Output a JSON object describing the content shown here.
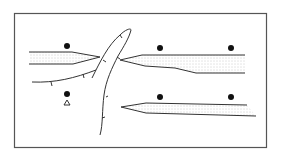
{
  "diagram": {
    "type": "schematic",
    "frame": {
      "x": 14,
      "y": 13,
      "w": 253,
      "h": 135
    },
    "colors": {
      "line": "#333333",
      "frame": "#555555",
      "stipple": "#999999",
      "dot": "#111111"
    },
    "symbols": {
      "dots": [
        {
          "name": "dot-upper-left",
          "x": 67,
          "y": 46
        },
        {
          "name": "dot-upper-mid",
          "x": 160,
          "y": 48
        },
        {
          "name": "dot-upper-right",
          "x": 231,
          "y": 48
        },
        {
          "name": "dot-lower-left",
          "x": 67,
          "y": 94
        },
        {
          "name": "dot-lower-mid",
          "x": 160,
          "y": 97
        },
        {
          "name": "dot-lower-right",
          "x": 231,
          "y": 97
        }
      ],
      "triangle": {
        "name": "triangle-marker",
        "x": 67,
        "y": 103,
        "label": "Δ"
      }
    },
    "slabs": [
      {
        "name": "upper-left-slab",
        "description": "stippled wedge tapering to the right"
      },
      {
        "name": "upper-right-slab",
        "description": "stippled wedge tapering to the left"
      },
      {
        "name": "lower-right-slab",
        "description": "stippled wedge pointing left"
      }
    ],
    "curves": [
      {
        "name": "central-hook-curve",
        "description": "elongated loop with tick marks"
      },
      {
        "name": "lower-left-arc",
        "description": "arc with tick marks"
      }
    ]
  }
}
